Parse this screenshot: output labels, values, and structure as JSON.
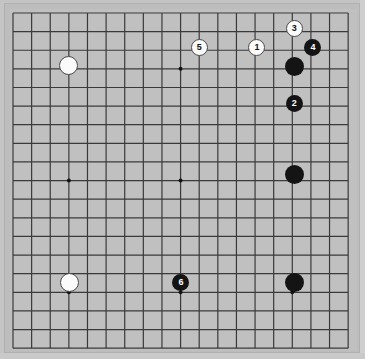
{
  "game": {
    "title": "Go Board Diagram",
    "board_size": 19,
    "type": "go-board"
  },
  "board": {
    "background_color": "#c0c0c0",
    "frame_color": "#b8b8b8",
    "line_color": "#3a3a3a",
    "star_point_color": "#141414",
    "grid_origin_x": 13,
    "grid_origin_y": 13,
    "grid_spacing": 18.62,
    "line_count": 19,
    "star_points": [
      {
        "col": 3,
        "row": 3
      },
      {
        "col": 9,
        "row": 3
      },
      {
        "col": 15,
        "row": 3
      },
      {
        "col": 3,
        "row": 9
      },
      {
        "col": 9,
        "row": 9
      },
      {
        "col": 15,
        "row": 9
      },
      {
        "col": 3,
        "row": 15
      },
      {
        "col": 9,
        "row": 15
      },
      {
        "col": 15,
        "row": 15
      }
    ]
  },
  "stones": [
    {
      "name": "white-stone-upper-left",
      "color": "white",
      "label": "",
      "col": 3,
      "row": 2.8,
      "diameter": 19
    },
    {
      "name": "move-5-white",
      "color": "white",
      "label": "5",
      "col": 10,
      "row": 1.85,
      "diameter": 17
    },
    {
      "name": "move-1-white",
      "color": "white",
      "label": "1",
      "col": 13.1,
      "row": 1.85,
      "diameter": 17
    },
    {
      "name": "move-3-white",
      "color": "white",
      "label": "3",
      "col": 15.1,
      "row": 0.85,
      "diameter": 17
    },
    {
      "name": "move-4-black",
      "color": "black",
      "label": "4",
      "col": 16.1,
      "row": 1.85,
      "diameter": 17
    },
    {
      "name": "black-stone-upper-right",
      "color": "black",
      "label": "",
      "col": 15.1,
      "row": 2.85,
      "diameter": 19
    },
    {
      "name": "move-2-black",
      "color": "black",
      "label": "2",
      "col": 15.1,
      "row": 4.85,
      "diameter": 17
    },
    {
      "name": "black-stone-right-center",
      "color": "black",
      "label": "",
      "col": 15.1,
      "row": 8.7,
      "diameter": 19
    },
    {
      "name": "white-stone-lower-left",
      "color": "white",
      "label": "",
      "col": 3.05,
      "row": 14.5,
      "diameter": 19
    },
    {
      "name": "move-6-black",
      "color": "black",
      "label": "6",
      "col": 9.02,
      "row": 14.5,
      "diameter": 17
    },
    {
      "name": "black-stone-lower-right",
      "color": "black",
      "label": "",
      "col": 15.1,
      "row": 14.5,
      "diameter": 19
    }
  ],
  "move_sequence": [
    {
      "number": "1",
      "color": "white"
    },
    {
      "number": "2",
      "color": "black"
    },
    {
      "number": "3",
      "color": "white"
    },
    {
      "number": "4",
      "color": "black"
    },
    {
      "number": "5",
      "color": "white"
    },
    {
      "number": "6",
      "color": "black"
    }
  ]
}
